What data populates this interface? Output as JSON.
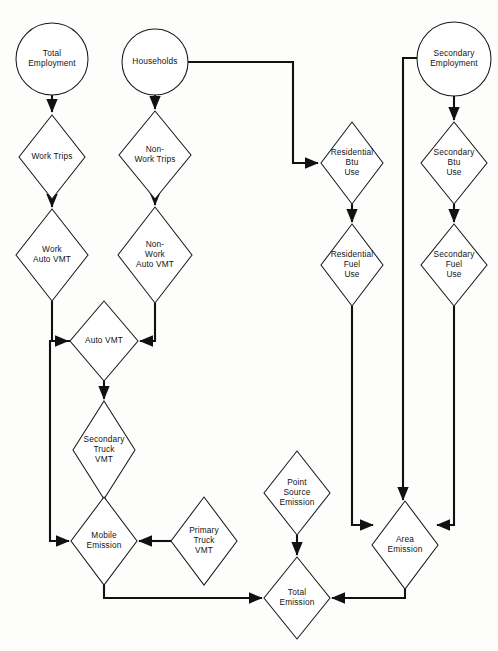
{
  "diagram": {
    "type": "flowchart",
    "background_color": "#fdfdfc",
    "line_color": "#111111",
    "shape_fill": "#ffffff",
    "nodes": [
      {
        "id": "total_employment",
        "shape": "circle",
        "label": "Total Employment",
        "lines": [
          "Total",
          "Employment"
        ],
        "cx": 52,
        "cy": 59,
        "r": 36
      },
      {
        "id": "households",
        "shape": "circle",
        "label": "Households",
        "lines": [
          "Households"
        ],
        "cx": 155,
        "cy": 62,
        "r": 33
      },
      {
        "id": "secondary_employment",
        "shape": "circle",
        "label": "Secondary Employment",
        "lines": [
          "Secondary",
          "Employment"
        ],
        "cx": 454,
        "cy": 59,
        "r": 37
      },
      {
        "id": "work_trips",
        "shape": "diamond",
        "label": "Work Trips",
        "lines": [
          "Work Trips"
        ],
        "cx": 52,
        "cy": 157,
        "rx": 33,
        "ry": 42
      },
      {
        "id": "non_work_trips",
        "shape": "diamond",
        "label": "Non-Work Trips",
        "lines": [
          "Non-",
          "Work Trips"
        ],
        "cx": 155,
        "cy": 155,
        "rx": 36,
        "ry": 44
      },
      {
        "id": "residential_btu",
        "shape": "diamond",
        "label": "Residential Btu Use",
        "lines": [
          "Residential",
          "Btu",
          "Use"
        ],
        "cx": 352,
        "cy": 163,
        "rx": 31,
        "ry": 41
      },
      {
        "id": "secondary_btu",
        "shape": "diamond",
        "label": "Secondary Btu Use",
        "lines": [
          "Secondary",
          "Btu",
          "Use"
        ],
        "cx": 454,
        "cy": 163,
        "rx": 33,
        "ry": 41
      },
      {
        "id": "work_auto_vmt",
        "shape": "diamond",
        "label": "Work Auto VMT",
        "lines": [
          "Work",
          "Auto VMT"
        ],
        "cx": 52,
        "cy": 255,
        "rx": 36,
        "ry": 46
      },
      {
        "id": "non_work_auto_vmt",
        "shape": "diamond",
        "label": "Non-Work Auto VMT",
        "lines": [
          "Non-",
          "Work",
          "Auto VMT"
        ],
        "cx": 155,
        "cy": 255,
        "rx": 37,
        "ry": 48
      },
      {
        "id": "residential_fuel",
        "shape": "diamond",
        "label": "Residential Fuel Use",
        "lines": [
          "Residential",
          "Fuel",
          "Use"
        ],
        "cx": 352,
        "cy": 265,
        "rx": 31,
        "ry": 41
      },
      {
        "id": "secondary_fuel",
        "shape": "diamond",
        "label": "Secondary Fuel Use",
        "lines": [
          "Secondary",
          "Fuel",
          "Use"
        ],
        "cx": 454,
        "cy": 265,
        "rx": 33,
        "ry": 41
      },
      {
        "id": "auto_vmt",
        "shape": "diamond",
        "label": "Auto VMT",
        "lines": [
          "Auto VMT"
        ],
        "cx": 104,
        "cy": 341,
        "rx": 34,
        "ry": 40
      },
      {
        "id": "secondary_truck_vmt",
        "shape": "diamond",
        "label": "Secondary Truck VMT",
        "lines": [
          "Secondary",
          "Truck",
          "VMT"
        ],
        "cx": 104,
        "cy": 450,
        "rx": 31,
        "ry": 49
      },
      {
        "id": "point_source",
        "shape": "diamond",
        "label": "Point Source Emission",
        "lines": [
          "Point",
          "Source",
          "Emission"
        ],
        "cx": 297,
        "cy": 493,
        "rx": 33,
        "ry": 42
      },
      {
        "id": "mobile_emission",
        "shape": "diamond",
        "label": "Mobile Emission",
        "lines": [
          "Mobile",
          "Emission"
        ],
        "cx": 104,
        "cy": 541,
        "rx": 33,
        "ry": 44
      },
      {
        "id": "primary_truck_vmt",
        "shape": "diamond",
        "label": "Primary Truck VMT",
        "lines": [
          "Primary",
          "Truck",
          "VMT"
        ],
        "cx": 204,
        "cy": 541,
        "rx": 33,
        "ry": 44
      },
      {
        "id": "area_emission",
        "shape": "diamond",
        "label": "Area Emission",
        "lines": [
          "Area",
          "Emission"
        ],
        "cx": 405,
        "cy": 545,
        "rx": 33,
        "ry": 44
      },
      {
        "id": "total_emission",
        "shape": "diamond",
        "label": "Total Emission",
        "lines": [
          "Total",
          "Emission"
        ],
        "cx": 297,
        "cy": 598,
        "rx": 33,
        "ry": 41
      }
    ],
    "edges": [
      {
        "id": "e1",
        "from": "total_employment",
        "to": "work_trips",
        "path": "M52,95 L52,112",
        "arrow": true
      },
      {
        "id": "e2",
        "from": "work_trips",
        "to": "work_auto_vmt",
        "path": "M52,199 L52,207",
        "arrow": true
      },
      {
        "id": "e3",
        "from": "households",
        "to": "non_work_trips",
        "path": "M155,95 L155,109",
        "arrow": true
      },
      {
        "id": "e4",
        "from": "non_work_trips",
        "to": "non_work_auto_vmt",
        "path": "M155,199 L155,205",
        "arrow": true
      },
      {
        "id": "e5",
        "from": "households",
        "to": "residential_btu",
        "path": "M188,62 L293,62 L293,163 L318,163",
        "arrow": true
      },
      {
        "id": "e6",
        "from": "secondary_employment",
        "to": "secondary_btu",
        "path": "M454,96 L454,120",
        "arrow": true
      },
      {
        "id": "e7",
        "from": "residential_btu",
        "to": "residential_fuel",
        "path": "M352,204 L352,222",
        "arrow": true
      },
      {
        "id": "e8",
        "from": "secondary_btu",
        "to": "secondary_fuel",
        "path": "M454,204 L454,222",
        "arrow": true
      },
      {
        "id": "e9",
        "from": "work_auto_vmt",
        "to": "auto_vmt",
        "path": "M52,301 L52,341 L68,341",
        "arrow": true
      },
      {
        "id": "e10",
        "from": "non_work_auto_vmt",
        "to": "auto_vmt",
        "path": "M155,303 L155,341 L140,341",
        "arrow": true
      },
      {
        "id": "e11",
        "from": "auto_vmt",
        "to": "secondary_truck_vmt",
        "path": "M104,381 L104,399",
        "arrow": true
      },
      {
        "id": "e12",
        "from": "auto_vmt",
        "to": "mobile_emission",
        "path": "M70,341 L50,341 L50,541 L69,541",
        "arrow": true
      },
      {
        "id": "e13",
        "from": "secondary_truck_vmt",
        "to": "mobile_emission",
        "path": "M104,499 L104,495",
        "arrow": true
      },
      {
        "id": "e14",
        "from": "primary_truck_vmt",
        "to": "mobile_emission",
        "path": "M171,541 L139,541",
        "arrow": true
      },
      {
        "id": "e15",
        "from": "point_source",
        "to": "total_emission",
        "path": "M297,535 L297,555",
        "arrow": true
      },
      {
        "id": "e16",
        "from": "mobile_emission",
        "to": "total_emission",
        "path": "M104,585 L104,598 L262,598",
        "arrow": true
      },
      {
        "id": "e17",
        "from": "residential_fuel",
        "to": "area_emission",
        "path": "M352,306 L352,525 L373,525",
        "arrow": true
      },
      {
        "id": "e18",
        "from": "secondary_fuel",
        "to": "area_emission",
        "path": "M454,306 L454,525 L437,525",
        "arrow": true
      },
      {
        "id": "e19",
        "from": "secondary_employment",
        "to": "area_emission",
        "path": "M417,58 L403,58 L403,500",
        "arrow": true
      },
      {
        "id": "e20",
        "from": "area_emission",
        "to": "total_emission",
        "path": "M405,589 L405,598 L332,598",
        "arrow": true
      }
    ]
  }
}
